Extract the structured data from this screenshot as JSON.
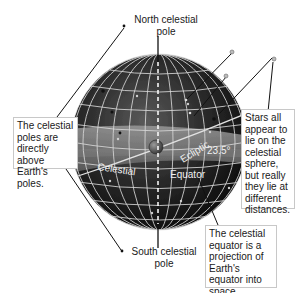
{
  "diagram": {
    "title": "Celestial sphere",
    "labels": {
      "north_pole": "North celestial\npole",
      "south_pole": "South celestial\npole",
      "ecliptic": "Ecliptic",
      "angle": "23.5°",
      "celestial": "Celestial",
      "equator": "Equator"
    },
    "callouts": {
      "poles": "The celestial poles are directly above Earth's poles.",
      "stars": "Stars all appear to lie on the celestial sphere, but really they lie at different distances.",
      "equator": "The celestial equator is a projection of Earth's equator into space."
    },
    "colors": {
      "sphere_dark": "#1c1c1c",
      "sphere_band": "#6e6e6e",
      "grid": "#d8d8d8",
      "box_border": "#c8c8c8",
      "text": "#1a1a1a"
    }
  }
}
